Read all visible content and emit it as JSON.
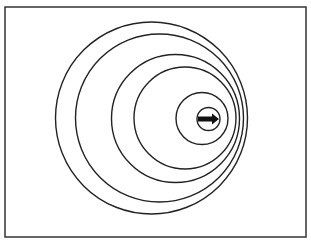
{
  "diagram": {
    "type": "doppler-wavefronts",
    "frame": {
      "x": 5,
      "y": 7,
      "width": 301,
      "height": 230,
      "stroke": "#333333"
    },
    "wavefronts": [
      {
        "cx": 151.5,
        "cy": 118,
        "r": 96
      },
      {
        "cx": 159.5,
        "cy": 118,
        "r": 84
      },
      {
        "cx": 175.5,
        "cy": 118.5,
        "r": 64
      },
      {
        "cx": 185,
        "cy": 118,
        "r": 51
      },
      {
        "cx": 202,
        "cy": 118.5,
        "r": 26
      },
      {
        "cx": 208.5,
        "cy": 119,
        "r": 11.5
      }
    ],
    "source": {
      "icon": "right-arrow-icon",
      "x1": 198,
      "x2": 219,
      "y": 119,
      "direction": "right"
    },
    "stroke_color": "#222222",
    "fill_color": "#111111"
  }
}
